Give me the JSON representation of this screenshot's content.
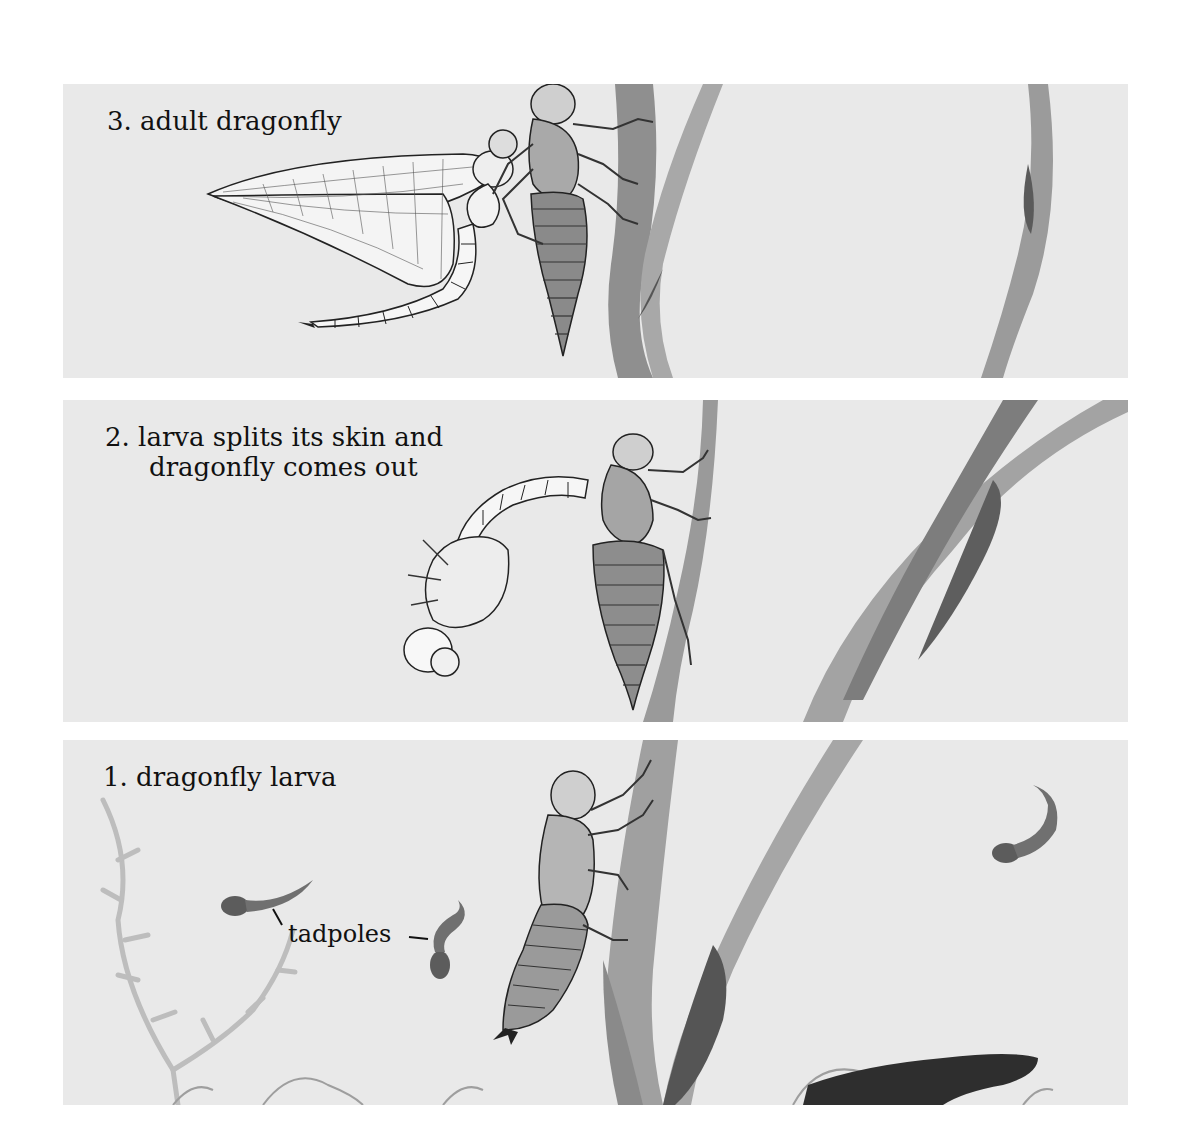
{
  "figure": {
    "panels": [
      {
        "id": "panel-3",
        "step": 3,
        "label": "3. adult dragonfly"
      },
      {
        "id": "panel-2",
        "step": 2,
        "label_line1": "2. larva splits its skin and",
        "label_line2": "dragonfly comes out"
      },
      {
        "id": "panel-1",
        "step": 1,
        "label": "1. dragonfly larva",
        "annotation": "tadpoles"
      }
    ]
  },
  "colors": {
    "panel_bg": "#e9e9e9",
    "reed": "#9a9a9a",
    "reed_dark": "#6e6e6e",
    "ink": "#222222",
    "tadpole": "#5c5c5c",
    "weed": "#bdbdbd"
  }
}
